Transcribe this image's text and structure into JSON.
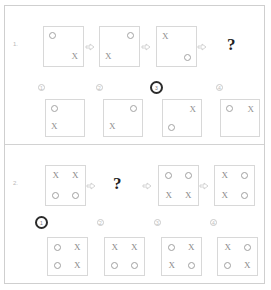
{
  "page": {
    "kind": "multiple-choice-worksheet",
    "symbol_x": "X",
    "symbol_o": "circle",
    "arrow_icon": "arrow-right-icon",
    "question_mark": "?",
    "colors": {
      "sheet_border": "#cfcfcf",
      "cell_border": "#d8d8d8",
      "glyph": "#8f8f8f",
      "selection_ring": "#2b2b2b",
      "question_mark": "#1f1f1f"
    }
  },
  "problems": [
    {
      "number": "1.",
      "sequence": [
        {
          "type": "cell",
          "cells": {
            "tl": "O",
            "tr": "",
            "bl": "",
            "br": "X"
          }
        },
        {
          "type": "arrow",
          "label": "⇒"
        },
        {
          "type": "cell",
          "cells": {
            "tl": "",
            "tr": "O",
            "bl": "X",
            "br": ""
          }
        },
        {
          "type": "arrow",
          "label": "⇒"
        },
        {
          "type": "cell",
          "cells": {
            "tl": "X",
            "tr": "",
            "bl": "",
            "br": "O"
          }
        },
        {
          "type": "arrow",
          "label": "⇒"
        },
        {
          "type": "question",
          "label": "?"
        }
      ],
      "options": [
        {
          "number": "1",
          "selected": false,
          "cells": {
            "tl": "O",
            "tr": "",
            "bl": "X",
            "br": ""
          }
        },
        {
          "number": "2",
          "selected": false,
          "cells": {
            "tl": "",
            "tr": "O",
            "bl": "X",
            "br": ""
          }
        },
        {
          "number": "3",
          "selected": true,
          "cells": {
            "tl": "",
            "tr": "X",
            "bl": "O",
            "br": ""
          }
        },
        {
          "number": "4",
          "selected": false,
          "cells": {
            "tl": "O",
            "tr": "X",
            "bl": "",
            "br": ""
          }
        }
      ]
    },
    {
      "number": "2.",
      "sequence": [
        {
          "type": "grid",
          "rows": [
            [
              "X",
              "X"
            ],
            [
              "O",
              "O"
            ]
          ]
        },
        {
          "type": "arrow",
          "label": "⇒"
        },
        {
          "type": "question",
          "label": "?"
        },
        {
          "type": "arrow",
          "label": "⇒"
        },
        {
          "type": "grid",
          "rows": [
            [
              "O",
              "O"
            ],
            [
              "X",
              "X"
            ]
          ]
        },
        {
          "type": "arrow",
          "label": "⇒"
        },
        {
          "type": "grid",
          "rows": [
            [
              "X",
              "O"
            ],
            [
              "X",
              "O"
            ]
          ]
        }
      ],
      "options": [
        {
          "number": "1",
          "selected": true,
          "rows": [
            [
              "O",
              "X"
            ],
            [
              "O",
              "X"
            ]
          ]
        },
        {
          "number": "2",
          "selected": false,
          "rows": [
            [
              "X",
              "X"
            ],
            [
              "O",
              "O"
            ]
          ]
        },
        {
          "number": "3",
          "selected": false,
          "rows": [
            [
              "O",
              "X"
            ],
            [
              "X",
              "O"
            ]
          ]
        },
        {
          "number": "4",
          "selected": false,
          "rows": [
            [
              "X",
              "O"
            ],
            [
              "O",
              "X"
            ]
          ]
        }
      ]
    }
  ]
}
